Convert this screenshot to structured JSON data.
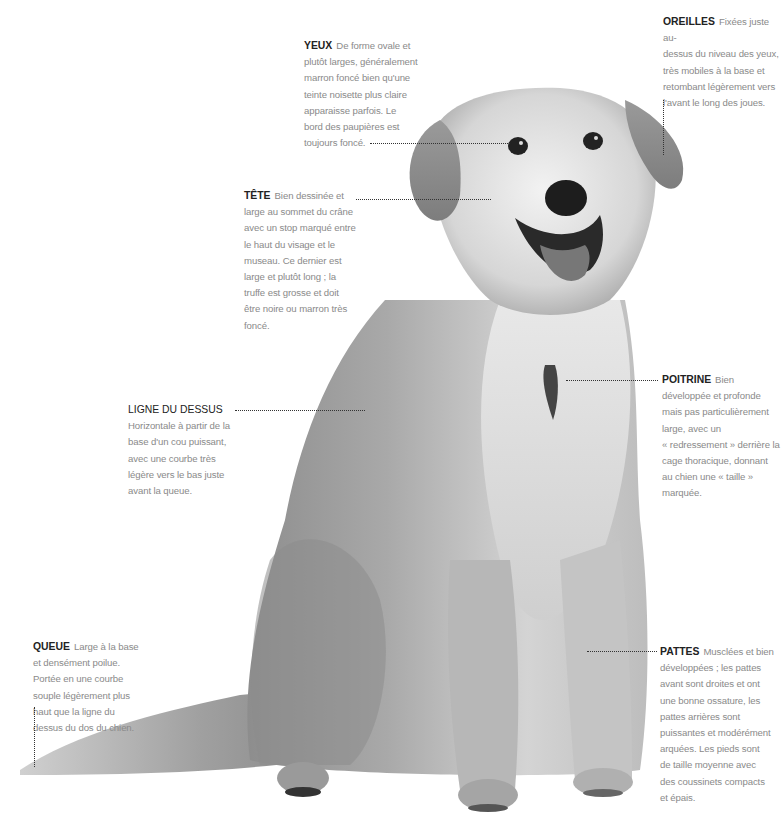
{
  "figure": {
    "colors": {
      "background": "#ffffff",
      "term": "#222222",
      "body_text": "#8a8a8a",
      "leader_line": "#333333"
    }
  },
  "annotations": {
    "yeux": {
      "term": "YEUX",
      "lines": [
        "De forme ovale et",
        "plutôt larges, généralement",
        "marron foncé bien qu'une",
        "teinte noisette plus claire",
        "apparaisse parfois. Le",
        "bord des paupières est",
        "toujours foncé."
      ]
    },
    "oreilles": {
      "term": "OREILLES",
      "lines": [
        "Fixées juste au-",
        "dessus du niveau des yeux,",
        "très mobiles à la base et",
        "retombant légèrement vers",
        "l'avant le long des joues."
      ]
    },
    "tete": {
      "term": "TÊTE",
      "lines": [
        "Bien dessinée et",
        "large au sommet du crâne",
        "avec un stop marqué entre",
        "le haut du visage et le",
        "museau. Ce dernier est",
        "large et plutôt long ; la",
        "truffe est grosse et doit",
        "être noire ou marron très",
        "foncé."
      ]
    },
    "ligne_du_dessus": {
      "term": "LIGNE DU DESSUS",
      "lines": [
        "Horizontale à partir de la",
        "base d'un cou puissant,",
        "avec une courbe très",
        "légère vers le bas juste",
        "avant la queue."
      ]
    },
    "poitrine": {
      "term": "POITRINE",
      "lines": [
        "Bien",
        "développée et profonde",
        "mais pas particulièrement",
        "large, avec un",
        "« redressement » derrière la",
        "cage thoracique, donnant",
        "au chien une « taille »",
        "marquée."
      ]
    },
    "queue": {
      "term": "QUEUE",
      "lines": [
        "Large à la base",
        "et densément poilue.",
        "Portée en une courbe",
        "souple légèrement plus",
        "haut que la ligne du",
        "dessus du dos du chien."
      ]
    },
    "pattes": {
      "term": "PATTES",
      "lines": [
        "Musclées et bien",
        "développées ; les pattes",
        "avant sont droites et ont",
        "une bonne ossature, les",
        "pattes arrières sont",
        "puissantes et modérément",
        "arquées. Les pieds sont",
        "de taille moyenne avec",
        "des coussinets compacts",
        "et épais."
      ]
    }
  }
}
